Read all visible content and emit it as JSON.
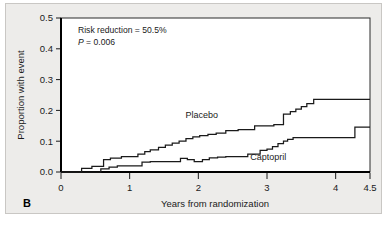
{
  "panel": {
    "label": "B"
  },
  "annotations": {
    "risk_reduction": "Risk reduction = 50.5%",
    "p_italic": "P",
    "p_value": " = 0.006"
  },
  "chart_data": {
    "type": "line",
    "subtype": "kaplan-meier-step",
    "title": "",
    "xlabel": "Years from randomization",
    "ylabel": "Proportion with event",
    "xlim": [
      0,
      4.5
    ],
    "ylim": [
      0.0,
      0.5
    ],
    "xticks": [
      0,
      1,
      2,
      3,
      4,
      4.5
    ],
    "xtick_labels": [
      "0",
      "1",
      "2",
      "3",
      "4",
      "4.5"
    ],
    "yticks": [
      0.0,
      0.1,
      0.2,
      0.3,
      0.4,
      0.5
    ],
    "ytick_labels": [
      "0.0",
      "0.1",
      "0.2",
      "0.3",
      "0.4",
      "0.5"
    ],
    "grid": false,
    "legend": "inline-labels",
    "series": [
      {
        "name": "Placebo",
        "label_x": 2.05,
        "label_y": 0.175,
        "x": [
          0.0,
          0.3,
          0.3,
          0.45,
          0.45,
          0.62,
          0.62,
          0.72,
          0.72,
          0.88,
          0.88,
          1.12,
          1.12,
          1.22,
          1.22,
          1.3,
          1.3,
          1.42,
          1.42,
          1.52,
          1.52,
          1.62,
          1.62,
          1.72,
          1.72,
          1.82,
          1.82,
          1.92,
          1.92,
          2.02,
          2.02,
          2.14,
          2.14,
          2.26,
          2.26,
          2.4,
          2.4,
          2.58,
          2.58,
          2.82,
          2.82,
          3.1,
          3.1,
          3.24,
          3.24,
          3.34,
          3.34,
          3.42,
          3.42,
          3.5,
          3.5,
          3.58,
          3.58,
          3.68,
          3.68,
          4.5
        ],
        "y": [
          0.0,
          0.0,
          0.012,
          0.012,
          0.018,
          0.018,
          0.04,
          0.04,
          0.045,
          0.045,
          0.05,
          0.05,
          0.058,
          0.058,
          0.066,
          0.066,
          0.072,
          0.072,
          0.08,
          0.08,
          0.087,
          0.087,
          0.094,
          0.094,
          0.1,
          0.1,
          0.108,
          0.108,
          0.114,
          0.114,
          0.118,
          0.118,
          0.122,
          0.122,
          0.126,
          0.126,
          0.134,
          0.134,
          0.138,
          0.138,
          0.15,
          0.15,
          0.154,
          0.154,
          0.188,
          0.188,
          0.196,
          0.196,
          0.204,
          0.204,
          0.212,
          0.212,
          0.222,
          0.222,
          0.236,
          0.236
        ]
      },
      {
        "name": "Captopril",
        "label_x": 3.02,
        "label_y": 0.04,
        "x": [
          0.0,
          0.58,
          0.58,
          0.7,
          0.7,
          0.82,
          0.82,
          1.18,
          1.18,
          1.3,
          1.3,
          1.74,
          1.74,
          1.84,
          1.84,
          1.94,
          1.94,
          2.06,
          2.06,
          2.16,
          2.16,
          2.28,
          2.28,
          2.4,
          2.4,
          2.72,
          2.72,
          2.9,
          2.9,
          3.0,
          3.0,
          3.08,
          3.08,
          3.16,
          3.16,
          3.24,
          3.24,
          3.3,
          3.3,
          3.38,
          3.38,
          4.28,
          4.28,
          4.5
        ],
        "y": [
          0.0,
          0.0,
          0.01,
          0.01,
          0.016,
          0.016,
          0.02,
          0.02,
          0.032,
          0.032,
          0.034,
          0.034,
          0.044,
          0.044,
          0.04,
          0.04,
          0.034,
          0.034,
          0.04,
          0.04,
          0.046,
          0.046,
          0.048,
          0.048,
          0.05,
          0.05,
          0.058,
          0.058,
          0.07,
          0.07,
          0.074,
          0.074,
          0.082,
          0.082,
          0.092,
          0.092,
          0.1,
          0.1,
          0.106,
          0.106,
          0.112,
          0.112,
          0.146,
          0.146
        ]
      }
    ]
  },
  "colors": {
    "card_background": "#edecea",
    "plot_background": "#ffffff",
    "curve_stroke": "#1a1a1a",
    "axis": "#000000",
    "text": "#1a1a1a"
  }
}
